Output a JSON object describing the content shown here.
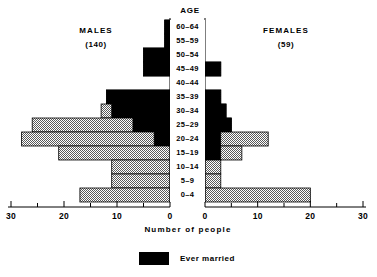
{
  "figure": {
    "age_axis_title": "AGE",
    "males_label": "MALES",
    "males_count": "(140)",
    "females_label": "FEMALES",
    "females_count": "(59)",
    "x_axis_title": "Number  of  people",
    "legend_label": "Ever married",
    "legend_color": "#000000",
    "total_color": "#b8b8b8",
    "axis_color": "#000000"
  },
  "chart_data": {
    "type": "bar",
    "subtype": "population-pyramid",
    "title": "",
    "xlabel": "Number  of  people",
    "ylabel": "AGE",
    "orientation": "horizontal",
    "grid": false,
    "legend": [
      "Ever married"
    ],
    "legend_position": "bottom-center",
    "left_panel": "MALES",
    "right_panel": "FEMALES",
    "left_total": 140,
    "right_total": 59,
    "xlim_left": [
      30,
      0
    ],
    "xlim_right": [
      0,
      30
    ],
    "xticks": [
      0,
      5,
      10,
      15,
      20,
      25,
      30
    ],
    "xtick_labels_left": [
      "30",
      "20",
      "10",
      "0"
    ],
    "xtick_labels_right": [
      "0",
      "10",
      "20",
      "30"
    ],
    "xtick_labels_shown": [
      30,
      20,
      10,
      0
    ],
    "categories": [
      "60-64",
      "55-59",
      "50-54",
      "45-49",
      "40-44",
      "35-39",
      "30-34",
      "25-29",
      "20-24",
      "15-19",
      "10-14",
      "5-9",
      "0-4"
    ],
    "series": [
      {
        "name": "Males total",
        "side": "left",
        "color": "#b8b8b8",
        "values": [
          1,
          1,
          5,
          5,
          0,
          12,
          13,
          26,
          28,
          21,
          11,
          11,
          17
        ]
      },
      {
        "name": "Males ever married",
        "side": "left",
        "color": "#000000",
        "values": [
          1,
          1,
          5,
          5,
          0,
          12,
          11,
          7,
          3,
          0,
          0,
          0,
          0
        ]
      },
      {
        "name": "Females total",
        "side": "right",
        "color": "#b8b8b8",
        "values": [
          0,
          0,
          0,
          3,
          0,
          3,
          4,
          5,
          12,
          7,
          3,
          3,
          20
        ]
      },
      {
        "name": "Females ever married",
        "side": "right",
        "color": "#000000",
        "values": [
          0,
          0,
          0,
          3,
          0,
          3,
          4,
          5,
          3,
          3,
          0,
          0,
          0
        ]
      }
    ]
  }
}
